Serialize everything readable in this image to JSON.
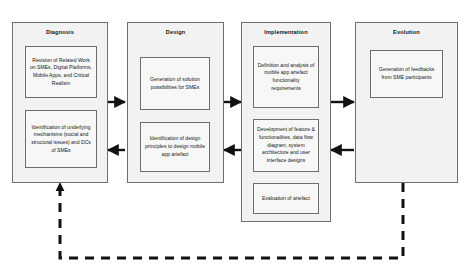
{
  "diagram": {
    "background_color": "#ffffff",
    "phase_fill_color": "#f2f2f2",
    "step_fill_color": "#f7f7f7",
    "border_color": "#6e6e6e",
    "arrow_color": "#111111",
    "feedback_line_style": "dashed"
  },
  "phases": [
    {
      "id": "diagnosis",
      "label": "Diagnosis",
      "steps": [
        {
          "id": "diagnosis-step-1",
          "text": "Revision of Related Work on SMEs, Digital Platforms, Mobile Apps, and Critical Realism"
        },
        {
          "id": "diagnosis-step-2",
          "text": "Identification of underlying mechanisms (social and structural issues) and DCs of SMEs"
        }
      ]
    },
    {
      "id": "design",
      "label": "Design",
      "steps": [
        {
          "id": "design-step-1",
          "text": "Generation of solution possibilities for SMEs"
        },
        {
          "id": "design-step-2",
          "text": "Identification of design principles to design mobile app artefact"
        }
      ]
    },
    {
      "id": "implementation",
      "label": "Implementation",
      "steps": [
        {
          "id": "implementation-step-1",
          "text": "Definition and analysis of mobile app artefact functionality requirements"
        },
        {
          "id": "implementation-step-2",
          "text": "Development of feature & functionalities, data flow diagram, system architecture and user interface designs"
        },
        {
          "id": "implementation-step-3",
          "text": "Evaluation of artefact"
        }
      ]
    },
    {
      "id": "evolution",
      "label": "Evolution",
      "steps": [
        {
          "id": "evolution-step-1",
          "text": "Generation of feedbacks from SME participants"
        }
      ]
    }
  ],
  "connectors": {
    "forward_arrows": [
      {
        "id": "diagnosis-to-design",
        "from": "diagnosis",
        "to": "design",
        "direction": "right"
      },
      {
        "id": "design-to-implementation",
        "from": "design",
        "to": "implementation",
        "direction": "right"
      },
      {
        "id": "implementation-to-evolution",
        "from": "implementation",
        "to": "evolution",
        "direction": "right"
      }
    ],
    "backward_arrows": [
      {
        "id": "design-to-diagnosis",
        "from": "design",
        "to": "diagnosis",
        "direction": "left"
      },
      {
        "id": "implementation-to-design",
        "from": "implementation",
        "to": "design",
        "direction": "left"
      },
      {
        "id": "evolution-to-implementation",
        "from": "evolution",
        "to": "implementation",
        "direction": "left"
      }
    ],
    "feedback_loop": {
      "id": "evolution-to-diagnosis-feedback",
      "from": "evolution",
      "to": "diagnosis",
      "style": "dashed",
      "direction": "up"
    },
    "internal_arrows": [
      {
        "id": "diagnosis-internal-1",
        "phase": "diagnosis",
        "direction": "down"
      },
      {
        "id": "design-internal-1",
        "phase": "design",
        "direction": "down"
      },
      {
        "id": "implementation-internal-1",
        "phase": "implementation",
        "direction": "down"
      },
      {
        "id": "implementation-internal-2",
        "phase": "implementation",
        "direction": "down"
      }
    ]
  }
}
